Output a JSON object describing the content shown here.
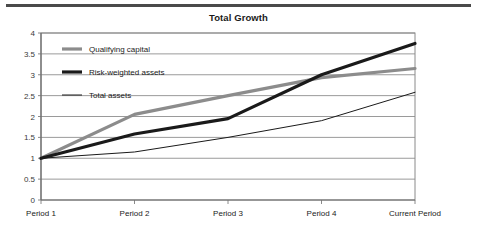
{
  "chart_data": {
    "type": "line",
    "title": "Total Growth",
    "xlabel": "",
    "ylabel": "",
    "categories": [
      "Period 1",
      "Period 2",
      "Period 3",
      "Period 4",
      "Current Period"
    ],
    "series": [
      {
        "name": "Qualifying capital",
        "values": [
          1,
          2.05,
          2.5,
          2.93,
          3.15
        ],
        "color": "#8c8c8c",
        "width": 3.2
      },
      {
        "name": "Risk-weighted assets",
        "values": [
          1,
          1.58,
          1.95,
          3.0,
          3.75
        ],
        "color": "#1a1a1a",
        "width": 3.2
      },
      {
        "name": "Total assets",
        "values": [
          1,
          1.15,
          1.5,
          1.9,
          2.58
        ],
        "color": "#1a1a1a",
        "width": 1
      }
    ],
    "ylim": [
      0,
      4
    ],
    "yticks": [
      "0",
      "0.5",
      "1",
      "1.5",
      "2",
      "2.5",
      "3",
      "3.5",
      "4"
    ],
    "ytick_values": [
      0,
      0.5,
      1,
      1.5,
      2,
      2.5,
      3,
      3.5,
      4
    ],
    "grid": true,
    "legend_position": "inside-top-left"
  },
  "legend": {
    "entries": [
      {
        "label": "Qualifying capital"
      },
      {
        "label": "Risk-weighted assets"
      },
      {
        "label": "Total assets"
      }
    ]
  }
}
